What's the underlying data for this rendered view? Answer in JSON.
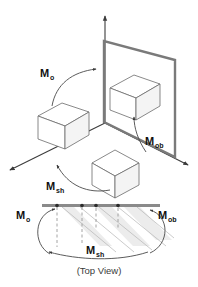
{
  "figure": {
    "caption": "(Top View)",
    "colors": {
      "plane_edge": "#7a7a7a",
      "axis": "#3c3c3c",
      "cube_stroke": "#6b6b6b",
      "cube_fill": "#ffffff",
      "cube_shade": "#f4f4f4",
      "top_bar": "#8a8a8a",
      "shear_band": "#ececec",
      "dashed_guide": "#9a9a9a",
      "label_text": "#111111",
      "caption_text": "#3a3a3a",
      "background": "#ffffff"
    },
    "labels": [
      {
        "id": "m-o-upper",
        "base": "M",
        "sub": "o",
        "x": 42,
        "y": 73
      },
      {
        "id": "m-ob-upper",
        "base": "M",
        "sub": "ob",
        "x": 148,
        "y": 141
      },
      {
        "id": "m-sh-upper",
        "base": "M",
        "sub": "sh",
        "x": 48,
        "y": 186
      },
      {
        "id": "m-o-top",
        "base": "M",
        "sub": "o",
        "x": 19,
        "y": 216
      },
      {
        "id": "m-ob-top",
        "base": "M",
        "sub": "ob",
        "x": 159,
        "y": 216
      },
      {
        "id": "m-sh-top",
        "base": "M",
        "sub": "sh",
        "x": 88,
        "y": 251
      }
    ],
    "objects": {
      "cube_object_space": "object-space-cube",
      "cube_world_space": "world-space-cube",
      "cube_shear_space": "shear-space-cube",
      "projection_plane": "projection-plane",
      "origin_axes": "coordinate-axes"
    },
    "top_view": {
      "bar_label": "projection-bar",
      "sample_dots": 4,
      "dashed_guides": 3,
      "shear_bands": 3
    }
  }
}
